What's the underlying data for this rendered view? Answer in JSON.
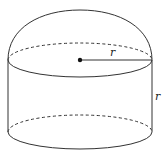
{
  "diagram": {
    "shape": "hemisphere atop cylinder",
    "stroke_color": "#333333",
    "labels": {
      "radius": "r",
      "height": "r"
    },
    "geometry": {
      "center": [
        80,
        60
      ],
      "radius_px": 72,
      "ellipse_ry_px": 16,
      "dome_top_y": 10,
      "cylinder_top_y": 60,
      "cylinder_bottom_y": 132
    }
  }
}
